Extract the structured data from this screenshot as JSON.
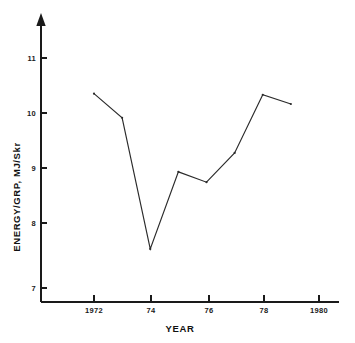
{
  "chart_data": {
    "type": "line",
    "title": "",
    "xlabel": "YEAR",
    "ylabel": "ENERGY/GRP, MJ/Skr",
    "x": [
      1972,
      1973,
      1974,
      1975,
      1976,
      1977,
      1978,
      1979
    ],
    "values": [
      10.38,
      9.96,
      7.68,
      9.02,
      8.84,
      9.35,
      10.36,
      10.2
    ],
    "series": [
      {
        "name": "ENERGY/GRP",
        "values": [
          10.38,
          9.96,
          7.68,
          9.02,
          8.84,
          9.35,
          10.36,
          10.2
        ]
      }
    ],
    "xlim": [
      1970.8,
      1980.7
    ],
    "ylim": [
      6.6,
      11.5
    ],
    "xticks": [
      1972,
      1974,
      1976,
      1978,
      1980
    ],
    "xticklabels": [
      "1972",
      "74",
      "76",
      "78",
      "1980"
    ],
    "yticks": [
      7,
      8,
      9,
      10,
      11
    ],
    "yticklabels": [
      "7",
      "8",
      "9",
      "10",
      "11"
    ],
    "grid": false,
    "legend": false,
    "legend_position": "none",
    "markers": "dot",
    "line_color": "#2b2b2b",
    "axis_color": "#1a1a1a",
    "background_color": "#ffffff",
    "y_axis_arrow": true
  },
  "figure": {
    "xlabel_display": "YEAR",
    "ylabel_display": "ENERGY/GRP, MJ/Skr"
  }
}
